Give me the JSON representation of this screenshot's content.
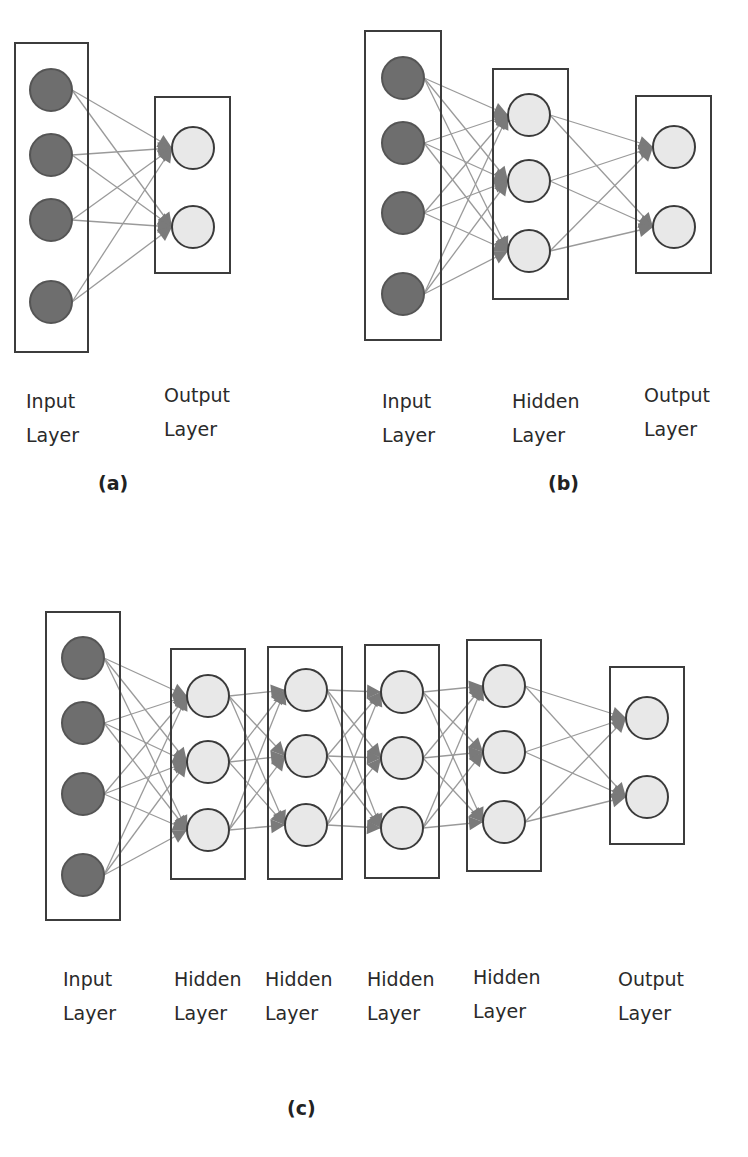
{
  "colors": {
    "input_node_fill": "#6e6e6e",
    "node_fill": "#e8e8e8",
    "node_stroke": "#3a3a3a",
    "box_stroke": "#3c3c3c",
    "edge": "#9a9a9a",
    "arrow": "#7a7a7a",
    "text": "#2a2a2a"
  },
  "diagrams": [
    {
      "id": "a",
      "caption": "(a)",
      "caption_pos": [
        98,
        472
      ],
      "layers": [
        {
          "type": "input",
          "box": [
            15,
            43,
            73,
            309
          ],
          "nodes": [
            [
              51,
              90
            ],
            [
              51,
              155
            ],
            [
              51,
              220
            ],
            [
              51,
              302
            ]
          ],
          "label_top": "Input",
          "label_bottom": "Layer",
          "label_pos": [
            26,
            384
          ]
        },
        {
          "type": "output",
          "box": [
            155,
            97,
            75,
            176
          ],
          "nodes": [
            [
              193,
              148
            ],
            [
              193,
              227
            ]
          ],
          "label_top": "Output",
          "label_bottom": "Layer",
          "label_pos": [
            164,
            378
          ]
        }
      ]
    },
    {
      "id": "b",
      "caption": "(b)",
      "caption_pos": [
        548,
        472
      ],
      "layers": [
        {
          "type": "input",
          "box": [
            365,
            31,
            76,
            309
          ],
          "nodes": [
            [
              403,
              78
            ],
            [
              403,
              143
            ],
            [
              403,
              213
            ],
            [
              403,
              294
            ]
          ],
          "label_top": "Input",
          "label_bottom": "Layer",
          "label_pos": [
            382,
            384
          ]
        },
        {
          "type": "hidden",
          "box": [
            493,
            69,
            75,
            230
          ],
          "nodes": [
            [
              529,
              115
            ],
            [
              529,
              181
            ],
            [
              529,
              251
            ]
          ],
          "label_top": "Hidden",
          "label_bottom": "Layer",
          "label_pos": [
            512,
            384
          ]
        },
        {
          "type": "output",
          "box": [
            636,
            96,
            75,
            177
          ],
          "nodes": [
            [
              674,
              147
            ],
            [
              674,
              227
            ]
          ],
          "label_top": "Output",
          "label_bottom": "Layer",
          "label_pos": [
            644,
            378
          ]
        }
      ]
    },
    {
      "id": "c",
      "caption": "(c)",
      "caption_pos": [
        287,
        1097
      ],
      "layers": [
        {
          "type": "input",
          "box": [
            46,
            612,
            74,
            308
          ],
          "nodes": [
            [
              83,
              658
            ],
            [
              83,
              723
            ],
            [
              83,
              794
            ],
            [
              83,
              875
            ]
          ],
          "label_top": "Input",
          "label_bottom": "Layer",
          "label_pos": [
            63,
            962
          ]
        },
        {
          "type": "hidden",
          "box": [
            171,
            649,
            74,
            230
          ],
          "nodes": [
            [
              208,
              696
            ],
            [
              208,
              762
            ],
            [
              208,
              830
            ]
          ],
          "label_top": "Hidden",
          "label_bottom": "Layer",
          "label_pos": [
            174,
            962
          ]
        },
        {
          "type": "hidden",
          "box": [
            268,
            647,
            74,
            232
          ],
          "nodes": [
            [
              306,
              690
            ],
            [
              306,
              756
            ],
            [
              306,
              825
            ]
          ],
          "label_top": "Hidden",
          "label_bottom": "Layer",
          "label_pos": [
            265,
            962
          ]
        },
        {
          "type": "hidden",
          "box": [
            365,
            645,
            74,
            233
          ],
          "nodes": [
            [
              402,
              692
            ],
            [
              402,
              758
            ],
            [
              402,
              828
            ]
          ],
          "label_top": "Hidden",
          "label_bottom": "Layer",
          "label_pos": [
            367,
            962
          ]
        },
        {
          "type": "hidden",
          "box": [
            467,
            640,
            74,
            231
          ],
          "nodes": [
            [
              504,
              686
            ],
            [
              504,
              752
            ],
            [
              504,
              822
            ]
          ],
          "label_top": "Hidden",
          "label_bottom": "Layer",
          "label_pos": [
            473,
            960
          ]
        },
        {
          "type": "output",
          "box": [
            610,
            667,
            74,
            177
          ],
          "nodes": [
            [
              647,
              718
            ],
            [
              647,
              797
            ]
          ],
          "label_top": "Output",
          "label_bottom": "Layer",
          "label_pos": [
            618,
            962
          ]
        }
      ]
    }
  ],
  "node_radius": 21
}
